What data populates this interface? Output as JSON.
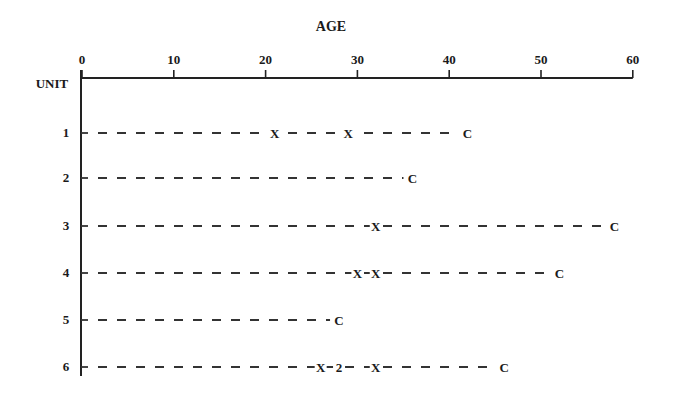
{
  "chart_data": {
    "type": "scatter",
    "title": "",
    "xlabel": "AGE",
    "ylabel": "UNIT",
    "xlim": [
      0,
      60
    ],
    "x_ticks": [
      0,
      10,
      20,
      30,
      40,
      50,
      60
    ],
    "x_axis_position": "top",
    "grid": false,
    "legend": null,
    "units": [
      {
        "unit": "1",
        "failures": [
          21,
          29
        ],
        "censor": 42,
        "markers": [
          {
            "age": 21,
            "label": "X"
          },
          {
            "age": 29,
            "label": "X"
          },
          {
            "age": 42,
            "label": "C"
          }
        ]
      },
      {
        "unit": "2",
        "failures": [],
        "censor": 36,
        "markers": [
          {
            "age": 36,
            "label": "C"
          }
        ]
      },
      {
        "unit": "3",
        "failures": [
          32
        ],
        "censor": 58,
        "markers": [
          {
            "age": 32,
            "label": "X"
          },
          {
            "age": 58,
            "label": "C"
          }
        ]
      },
      {
        "unit": "4",
        "failures": [
          30,
          32
        ],
        "censor": 52,
        "markers": [
          {
            "age": 30,
            "label": "X"
          },
          {
            "age": 32,
            "label": "X"
          },
          {
            "age": 52,
            "label": "C"
          }
        ]
      },
      {
        "unit": "5",
        "failures": [],
        "censor": 28,
        "markers": [
          {
            "age": 28,
            "label": "C"
          }
        ]
      },
      {
        "unit": "6",
        "failures": [
          26,
          28,
          28,
          32
        ],
        "censor": 46,
        "markers": [
          {
            "age": 26,
            "label": "X"
          },
          {
            "age": 28,
            "label": "2"
          },
          {
            "age": 32,
            "label": "X"
          },
          {
            "age": 46,
            "label": "C"
          }
        ]
      }
    ]
  },
  "labels": {
    "x_axis_title": "AGE",
    "y_axis_title": "UNIT"
  },
  "layout": {
    "x0_px": 82,
    "px_per_unit": 9.18,
    "axis_y_px": 78,
    "row_y_px": [
      133,
      178,
      226,
      273,
      320,
      367
    ]
  }
}
